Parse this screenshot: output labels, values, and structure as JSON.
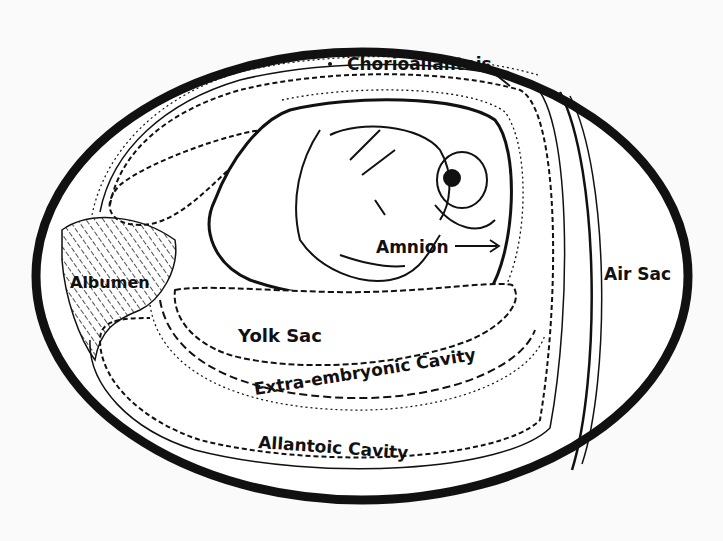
{
  "diagram": {
    "labels": {
      "chorioallantois": "Chorioallantois",
      "amnion": "Amnion",
      "albumen": "Albumen",
      "air_sac": "Air Sac",
      "yolk_sac": "Yolk Sac",
      "extra_embryonic_cavity": "Extra-embryonic Cavity",
      "allantoic_cavity": "Allantoic Cavity"
    },
    "colors": {
      "ink": "#111111",
      "paper": "#fafafa"
    }
  }
}
